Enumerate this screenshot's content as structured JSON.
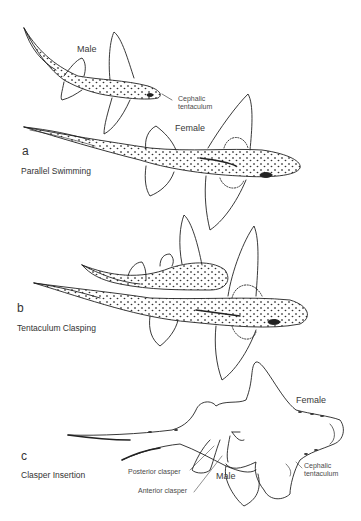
{
  "figure": {
    "panels": [
      {
        "letter": "a",
        "title": "Parallel Swimming",
        "labels": {
          "male": "Male",
          "female": "Female",
          "cephalic_tentaculum_line1": "Cephalic",
          "cephalic_tentaculum_line2": "tentaculum"
        }
      },
      {
        "letter": "b",
        "title": "Tentaculum Clasping"
      },
      {
        "letter": "c",
        "title": "Clasper Insertion",
        "labels": {
          "female": "Female",
          "male": "Male",
          "posterior_clasper": "Posterior clasper",
          "anterior_clasper": "Anterior clasper",
          "cephalic_tentaculum_line1": "Cephalic",
          "cephalic_tentaculum_line2": "tentaculum"
        }
      }
    ],
    "colors": {
      "line": "#222222",
      "text": "#333333",
      "background": "#ffffff"
    }
  }
}
